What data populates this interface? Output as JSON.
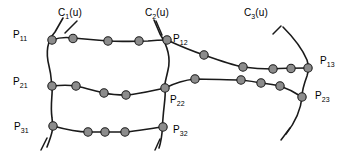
{
  "figure": {
    "kind": "curve-network-diagram",
    "background": "#ffffff",
    "width": 352,
    "height": 156,
    "stroke_color": "#1a1a1a",
    "node_fill": "#8c8c8c",
    "node_stroke": "#1a1a1a",
    "node_radius": 4.2
  },
  "labels": {
    "c1": {
      "text": "C",
      "sub": "1",
      "tail": "(u)",
      "x": 58,
      "y": 8
    },
    "c2": {
      "text": "C",
      "sub": "2",
      "tail": "(u)",
      "x": 145,
      "y": 8
    },
    "c3": {
      "text": "C",
      "sub": "3",
      "tail": "(u)",
      "x": 244,
      "y": 8
    },
    "p11": {
      "text": "P",
      "sub": "11",
      "tail": "",
      "x": 13,
      "y": 30
    },
    "p12": {
      "text": "P",
      "sub": "12",
      "tail": "",
      "x": 173,
      "y": 34
    },
    "p13": {
      "text": "P",
      "sub": "13",
      "tail": "",
      "x": 320,
      "y": 56
    },
    "p21": {
      "text": "P",
      "sub": "21",
      "tail": "",
      "x": 13,
      "y": 77
    },
    "p22": {
      "text": "P",
      "sub": "22",
      "tail": "",
      "x": 170,
      "y": 95
    },
    "p23": {
      "text": "P",
      "sub": "23",
      "tail": "",
      "x": 315,
      "y": 91
    },
    "p31": {
      "text": "P",
      "sub": "31",
      "tail": "",
      "x": 14,
      "y": 122
    },
    "p32": {
      "text": "P",
      "sub": "32",
      "tail": "",
      "x": 173,
      "y": 125
    }
  },
  "curves": {
    "c1_vertical": "M 63 18 L 55 32 C 46 42 46 54 49 66 C 52 78 51 82 52 86 C 53 94 50 104 52 118 C 54 128 52 134 47 147",
    "c2_vertical": "M 154 20 L 160 34 C 167 45 171 58 168 70 C 166 80 164 84 165 88 C 166 96 164 104 163 118 C 162 128 163 136 159 148",
    "c3_vertical": "M 283 27 C 292 36 302 48 307 60 C 309 66 309 70 307 76 C 304 84 302 90 302 97 C 301 108 297 120 286 134",
    "row1_left": "M 52 40 C 60 37 66 37 73 38 C 84 39 96 40 108 41 C 122 42 137 41 148 41 C 157 40 163 40 167 40",
    "row1_right": "M 167 40 C 180 46 192 51 204 55 C 218 60 232 65 243 67 C 257 69 268 69 273 69 C 284 68 295 68 308 68",
    "row2_left": "M 52 86 C 62 85 69 85 76 86 C 86 88 95 91 104 93 C 113 95 120 95 126 95 C 140 94 155 90 165 88",
    "row2_right": "M 165 88 C 175 83 185 80 195 79 C 210 79 228 80 241 80 C 250 81 256 82 261 83 C 270 84 276 85 280 86 C 289 89 296 93 302 97",
    "row3_left": "M 53 126 C 64 129 76 132 88 132 C 96 132 100 132 105 132 C 113 132 119 132 125 132 C 138 131 152 128 163 127"
  },
  "ticks": {
    "c1_top": "M 77 21 L 65 33",
    "c1_bottom": "M 47 138 L 41 150",
    "c2_top": "M 156 21 L 162 35",
    "c2_bottom": "M 160 139 L 155 150",
    "c3_top": "M 281 26 L 273 34",
    "c3_bottom": "M 290 128 L 281 140",
    "p11_tail": "M 50 44 L 45 52",
    "p31_tail": "M 52 130 L 46 140"
  },
  "nodes": [
    {
      "name": "p11",
      "x": 52,
      "y": 40
    },
    {
      "name": "n-top-1",
      "x": 73,
      "y": 38.5
    },
    {
      "name": "n-top-2",
      "x": 108,
      "y": 41
    },
    {
      "name": "n-top-3",
      "x": 139,
      "y": 41
    },
    {
      "name": "p12",
      "x": 167,
      "y": 40
    },
    {
      "name": "n-tr-1",
      "x": 204,
      "y": 55
    },
    {
      "name": "n-tr-2",
      "x": 243,
      "y": 67
    },
    {
      "name": "n-tr-3",
      "x": 273,
      "y": 69
    },
    {
      "name": "n-tr-4",
      "x": 291,
      "y": 68.5
    },
    {
      "name": "p13",
      "x": 308,
      "y": 68
    },
    {
      "name": "p21",
      "x": 52,
      "y": 86
    },
    {
      "name": "n-mid-1",
      "x": 76,
      "y": 86
    },
    {
      "name": "n-mid-2",
      "x": 104,
      "y": 93
    },
    {
      "name": "n-mid-3",
      "x": 126,
      "y": 95
    },
    {
      "name": "p22",
      "x": 165,
      "y": 88
    },
    {
      "name": "n-mr-1",
      "x": 195,
      "y": 79
    },
    {
      "name": "n-mr-2",
      "x": 241,
      "y": 80
    },
    {
      "name": "n-mr-3",
      "x": 261,
      "y": 83
    },
    {
      "name": "n-mr-4",
      "x": 280,
      "y": 86
    },
    {
      "name": "p23",
      "x": 302,
      "y": 97
    },
    {
      "name": "p31",
      "x": 53,
      "y": 126
    },
    {
      "name": "n-bot-1",
      "x": 88,
      "y": 132
    },
    {
      "name": "n-bot-2",
      "x": 105,
      "y": 132
    },
    {
      "name": "n-bot-3",
      "x": 125,
      "y": 132
    },
    {
      "name": "p32",
      "x": 163,
      "y": 127
    }
  ]
}
